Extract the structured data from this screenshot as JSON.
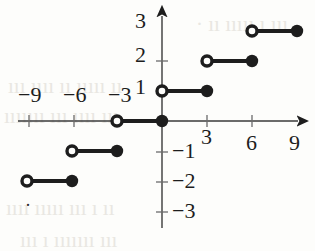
{
  "chart_data": {
    "type": "line",
    "title": "",
    "subtitle": "",
    "xlabel": "",
    "ylabel": "",
    "xlim": [
      -10.2,
      9.6
    ],
    "ylim": [
      -3.5,
      3.5
    ],
    "grid": false,
    "legend": null,
    "x_ticks": [
      -9,
      -6,
      -3,
      3,
      6,
      9
    ],
    "x_tick_labels": [
      "−9",
      "−6",
      "−3",
      "3",
      "6",
      "9"
    ],
    "y_ticks": [
      -3,
      -2,
      -1,
      1,
      2,
      3
    ],
    "y_tick_labels": [
      "−3",
      "−2",
      "−1",
      "1",
      "2",
      "3"
    ],
    "series": [
      {
        "name": "step",
        "segments": [
          {
            "x_start": -9,
            "x_end": -6,
            "y": -2,
            "left_endpoint": "open",
            "right_endpoint": "closed"
          },
          {
            "x_start": -6,
            "x_end": -3,
            "y": -1,
            "left_endpoint": "open",
            "right_endpoint": "closed"
          },
          {
            "x_start": -3,
            "x_end": 0,
            "y": 0,
            "left_endpoint": "open",
            "right_endpoint": "closed"
          },
          {
            "x_start": 0,
            "x_end": 3,
            "y": 1,
            "left_endpoint": "open",
            "right_endpoint": "closed"
          },
          {
            "x_start": 3,
            "x_end": 6,
            "y": 2,
            "left_endpoint": "open",
            "right_endpoint": "closed"
          },
          {
            "x_start": 6,
            "x_end": 9,
            "y": 3,
            "left_endpoint": "open",
            "right_endpoint": "closed"
          }
        ]
      }
    ],
    "colors": {
      "stroke": "#1d1d1d",
      "fill_closed": "#1d1d1d",
      "fill_open": "#fdfdfb",
      "background": "#fdfdfb"
    }
  },
  "axes": {
    "x_tick_labels_above": [
      {
        "text": "−9",
        "x": 29,
        "y": 95
      },
      {
        "text": "−6",
        "x": 74,
        "y": 95
      },
      {
        "text": "−3",
        "x": 119,
        "y": 95
      }
    ],
    "x_tick_labels_below": [
      {
        "text": "3",
        "x": 208,
        "y": 135
      },
      {
        "text": "6",
        "x": 252,
        "y": 135
      },
      {
        "text": "9",
        "x": 296,
        "y": 135
      }
    ],
    "y_tick_labels_left": [
      {
        "text": "3",
        "x": 142,
        "y": 22
      },
      {
        "text": "2",
        "x": 142,
        "y": 56
      },
      {
        "text": "1",
        "x": 142,
        "y": 88
      }
    ],
    "y_tick_labels_right": [
      {
        "text": "−1",
        "x": 184,
        "y": 152
      },
      {
        "text": "−2",
        "x": 184,
        "y": 182
      },
      {
        "text": "−3",
        "x": 184,
        "y": 212
      }
    ]
  },
  "watermark": {
    "lines": [
      {
        "text": "· ıı ııııı ı ııı",
        "x": 196,
        "y": 12
      },
      {
        "text": "ııı ıııı ıı ııııı ıı",
        "x": 8,
        "y": 74
      },
      {
        "text": "ııııııı ııı ıııı ııı",
        "x": 4,
        "y": 104
      },
      {
        "text": "ıııı ııııı ııı ı ıı",
        "x": 6,
        "y": 196
      },
      {
        "text": "ııı ı ııııııı ııı",
        "x": 20,
        "y": 228
      }
    ],
    "stray_mark": {
      "text": "·",
      "x": 28,
      "y": 205
    }
  }
}
